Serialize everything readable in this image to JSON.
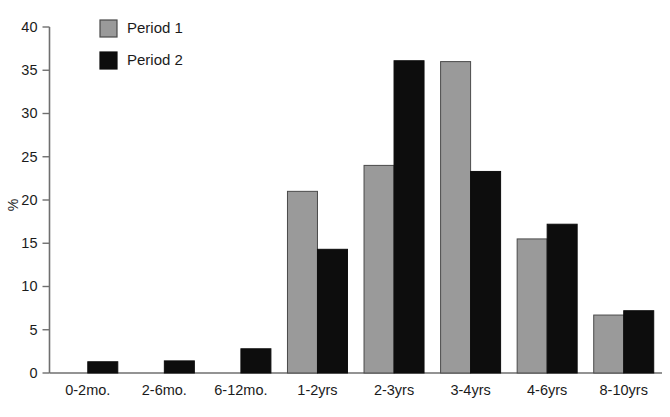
{
  "chart_data": {
    "type": "bar",
    "title": "",
    "subtitle": "",
    "xlabel": "",
    "ylabel": "%",
    "ylim": [
      0,
      40
    ],
    "yticks": [
      0,
      5,
      10,
      15,
      20,
      25,
      30,
      35,
      40
    ],
    "ytick_labels": [
      "0",
      "5",
      "10",
      "15",
      "20",
      "25",
      "30",
      "35",
      "40"
    ],
    "grid": false,
    "legend_position": "top-left",
    "categories": [
      "0-2mo.",
      "2-6mo.",
      "6-12mo.",
      "1-2yrs",
      "2-3yrs",
      "3-4yrs",
      "4-6yrs",
      "8-10yrs"
    ],
    "series": [
      {
        "name": "Period 1",
        "color": "#9a9a9a",
        "values": [
          0,
          0,
          0,
          21.0,
          24.0,
          36.0,
          15.5,
          6.7
        ]
      },
      {
        "name": "Period 2",
        "color": "#0d0d0d",
        "values": [
          1.3,
          1.4,
          2.8,
          14.3,
          36.1,
          23.3,
          17.2,
          7.2
        ]
      }
    ]
  },
  "legend": {
    "items": [
      {
        "label": "Period 1",
        "color": "#9a9a9a"
      },
      {
        "label": "Period 2",
        "color": "#0d0d0d"
      }
    ]
  },
  "axes": {
    "y_title": "%"
  },
  "colors": {
    "axis": "#6f6f6f",
    "text": "#1b1b1b",
    "background": "#ffffff",
    "series1": "#9a9a9a",
    "series2": "#0d0d0d"
  }
}
